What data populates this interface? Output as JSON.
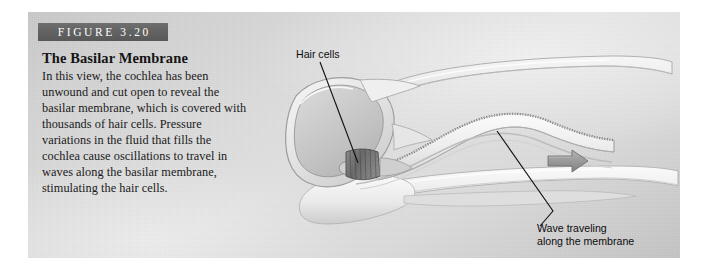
{
  "figure": {
    "banner_label": "FIGURE 3.20",
    "title": "The Basilar Membrane",
    "body": "In this view, the cochlea has been unwound and cut open to reveal the basilar membrane, which is covered with thousands of hair cells. Pressure variations in the fluid that fills the cochlea cause oscillations to travel in waves along the basilar membrane, stimulating the hair cells."
  },
  "annotations": {
    "hair_cells": "Hair cells",
    "wave_line1": "Wave traveling",
    "wave_line2": "along the membrane"
  },
  "illustration": {
    "subject": "unwound-cochlea",
    "parts": [
      "oval-chamber",
      "upper-tube",
      "lower-tube",
      "basilar-membrane-wave",
      "hair-cell-patch",
      "direction-arrow"
    ],
    "arrow_direction": "right"
  },
  "colors": {
    "panel_light": "#e2e2e2",
    "panel_dark": "#c4c4c4",
    "banner": "#636363",
    "banner_text": "#ffffff",
    "caption_text": "#1a1a1a",
    "annotation_text": "#0d0d0d",
    "leader_line": "#111111",
    "arrow_fill": "#9a9a9a",
    "membrane_stroke": "#8f8f8f",
    "hair_patch": "#6d6d6d"
  }
}
